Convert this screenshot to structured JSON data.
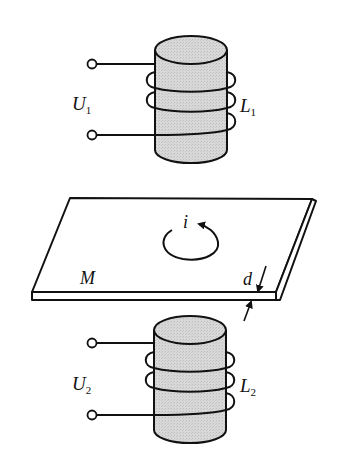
{
  "figure": {
    "colors": {
      "stroke": "#111111",
      "core_fill": "#d4d4d4",
      "background": "#ffffff"
    }
  },
  "labels": {
    "upper_voltage": {
      "main": "U",
      "sub": "1"
    },
    "upper_coil": {
      "main": "L",
      "sub": "1"
    },
    "lower_voltage": {
      "main": "U",
      "sub": "2"
    },
    "lower_coil": {
      "main": "L",
      "sub": "2"
    },
    "plate": "M",
    "eddy_current": "i",
    "thickness": "d"
  },
  "components": [
    {
      "id": "coil-upper",
      "type": "solenoid",
      "turns": 3,
      "terminals": 2
    },
    {
      "id": "metal-plate",
      "type": "plate"
    },
    {
      "id": "coil-lower",
      "type": "solenoid",
      "turns": 3,
      "terminals": 2
    }
  ]
}
